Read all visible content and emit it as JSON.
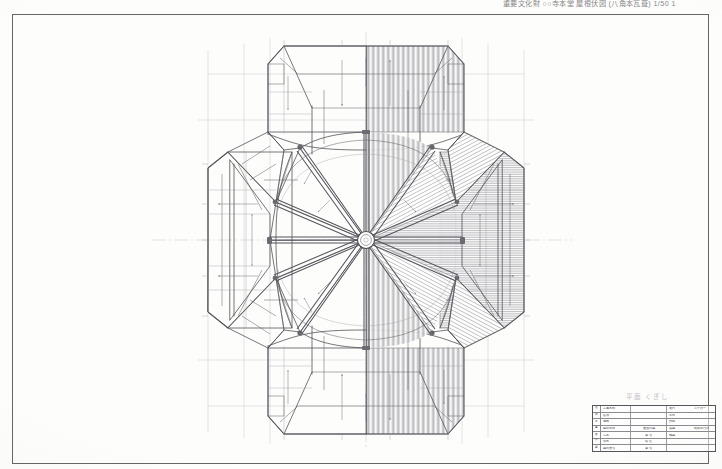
{
  "sheet": {
    "header_caption": "重要文化財 ○○寺本堂 屋根伏図 (八角本瓦葺) 1/50 1",
    "note": "平面 くぎし",
    "background_color": "#fdfdfc",
    "ink_color": "#3a3a3a",
    "frame_color": "#5d5d60"
  },
  "drawing": {
    "name": "roof-plan",
    "title": "屋根伏図",
    "center": {
      "x": 354,
      "y": 226
    },
    "hatch_side": "right",
    "plain_side": "left",
    "radial_rafters": 12,
    "notes": [
      "octagonal hipped roof with radiating hip rafters",
      "central finial ring at plan centre",
      "four projecting gabled wings (north, south, east, west)",
      "right half rendered with tile hatching, left half outline only"
    ]
  },
  "title_block": {
    "rows": [
      {
        "stub": "名",
        "label": "工事名称",
        "mid": "",
        "r1": "縮尺",
        "r2": "三十分一"
      },
      {
        "stub": "称",
        "label": "建  物",
        "mid": "",
        "r1": "主  任",
        "r2": ""
      },
      {
        "stub": "工",
        "label": "階  数",
        "mid": "",
        "r1": "技  師",
        "r2": ""
      },
      {
        "stub": "事",
        "label": "図面名称",
        "mid": "屋根伏図",
        "r1": "製  図",
        "r2": "昭和年月日"
      },
      {
        "stub": "番",
        "label": "工  区",
        "mid": "第  号",
        "r1": "検  図",
        "r2": ""
      },
      {
        "stub": "号",
        "label": "係  名",
        "mid": "修  理",
        "r1": "",
        "r2": ""
      },
      {
        "stub": "図",
        "label": "図面番号",
        "mid": "第  号",
        "r1": "",
        "r2": ""
      }
    ]
  }
}
